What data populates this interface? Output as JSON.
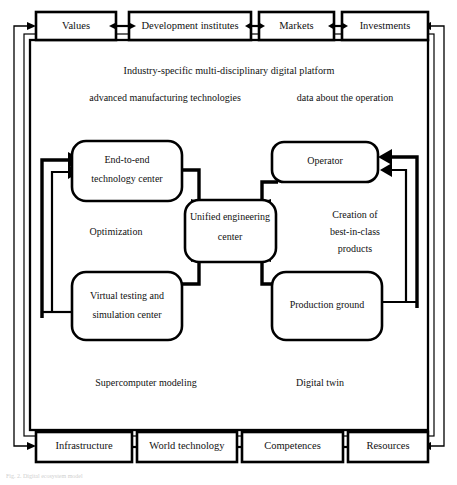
{
  "figure": {
    "caption": "Fig. 2. Digital ecosystem model",
    "background_color": "#ffffff",
    "line_color": "#000000"
  },
  "top_row": {
    "items": [
      {
        "label": "Values"
      },
      {
        "label": "Development institutes"
      },
      {
        "label": "Markets"
      },
      {
        "label": "Investments"
      }
    ]
  },
  "bottom_row": {
    "items": [
      {
        "label": "Infrastructure"
      },
      {
        "label": "World technology"
      },
      {
        "label": "Competences"
      },
      {
        "label": "Resources"
      }
    ]
  },
  "platform": {
    "title": "Industry-specific multi-disciplinary digital platform",
    "left_input": "advanced manufacturing technologies",
    "right_input": "data about the operation"
  },
  "nodes": {
    "end_to_end": {
      "line1": "End-to-end",
      "line2": "technology center"
    },
    "operator": {
      "line1": "Operator"
    },
    "unified": {
      "line1": "Unified engineering",
      "line2": "center"
    },
    "virtual_testing": {
      "line1": "Virtual testing and",
      "line2": "simulation center"
    },
    "production_ground": {
      "line1": "Production ground"
    }
  },
  "free_labels": {
    "optimization": "Optimization",
    "creation_line1": "Creation of",
    "creation_line2": "best-in-class",
    "creation_line3": "products",
    "supercomputer": "Supercomputer modeling",
    "digital_twin": "Digital twin"
  }
}
